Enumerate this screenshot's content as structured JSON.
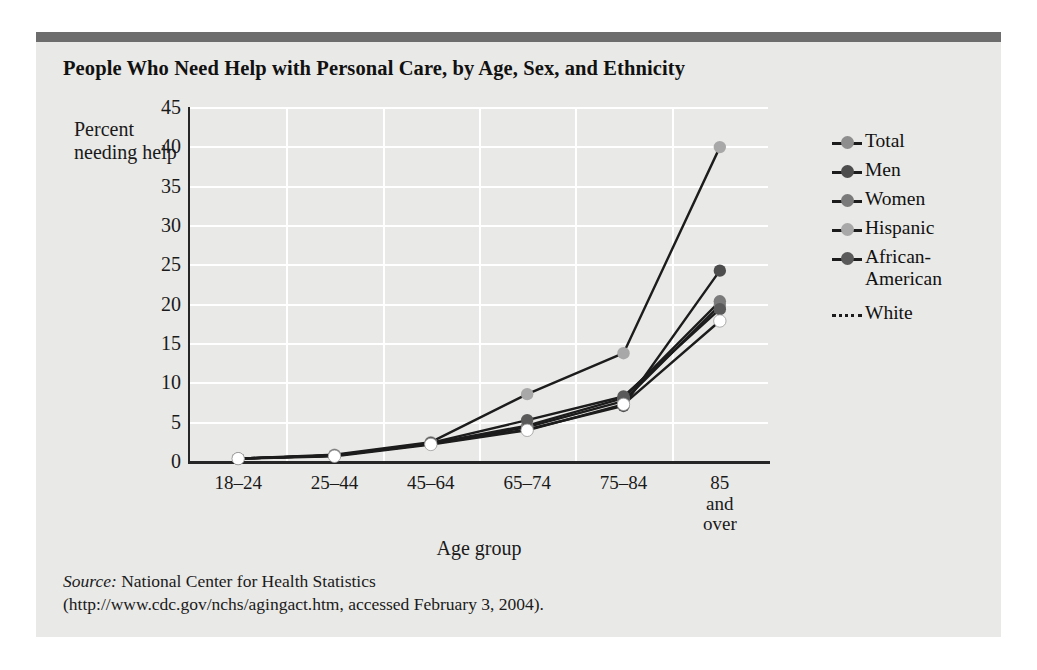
{
  "figure": {
    "title": "People Who Need Help with Personal Care, by Age, Sex, and Ethnicity"
  },
  "source": {
    "label": "Source:",
    "line1_rest": " National Center for Health Statistics",
    "line2": "(http://www.cdc.gov/nchs/agingact.htm, accessed February 3, 2004)."
  },
  "legend": {
    "position": "right",
    "entries": [
      {
        "label": "Total",
        "color": "#8e8e8e",
        "style": "solid"
      },
      {
        "label": "Men",
        "color": "#4d4d4d",
        "style": "solid"
      },
      {
        "label": "Women",
        "color": "#7a7a7a",
        "style": "solid"
      },
      {
        "label": "Hispanic",
        "color": "#a8a8a8",
        "style": "solid"
      },
      {
        "label": "African-\nAmerican",
        "color": "#5a5a5a",
        "style": "solid"
      },
      {
        "label": "White",
        "color": "#ffffff",
        "style": "dashed"
      }
    ]
  },
  "chart_data": {
    "type": "line",
    "title": "People Who Need Help with Personal Care, by Age, Sex, and Ethnicity",
    "xlabel": "Age group",
    "ylabel": "Percent needing help",
    "categories": [
      "18–24",
      "25–44",
      "45–64",
      "65–74",
      "75–84",
      "85 and\nover"
    ],
    "ylim": [
      0,
      45
    ],
    "yticks": [
      0,
      5,
      10,
      15,
      20,
      25,
      30,
      35,
      40,
      45
    ],
    "grid": true,
    "series": [
      {
        "name": "Total",
        "color": "#8e8e8e",
        "values": [
          0.3,
          0.7,
          2.2,
          4.3,
          7.6,
          19.8
        ]
      },
      {
        "name": "Men",
        "color": "#4d4d4d",
        "values": [
          0.3,
          0.7,
          2.2,
          4.0,
          7.0,
          24.2
        ]
      },
      {
        "name": "Women",
        "color": "#7a7a7a",
        "values": [
          0.3,
          0.7,
          2.2,
          4.5,
          8.0,
          20.3
        ]
      },
      {
        "name": "Hispanic",
        "color": "#a8a8a8",
        "values": [
          0.3,
          0.8,
          2.4,
          8.5,
          13.7,
          39.9
        ]
      },
      {
        "name": "African-American",
        "color": "#5a5a5a",
        "values": [
          0.3,
          0.7,
          2.3,
          5.2,
          8.2,
          19.3
        ]
      },
      {
        "name": "White",
        "color": "#ffffff",
        "values": [
          0.3,
          0.6,
          2.1,
          3.9,
          7.2,
          17.8
        ]
      }
    ]
  }
}
